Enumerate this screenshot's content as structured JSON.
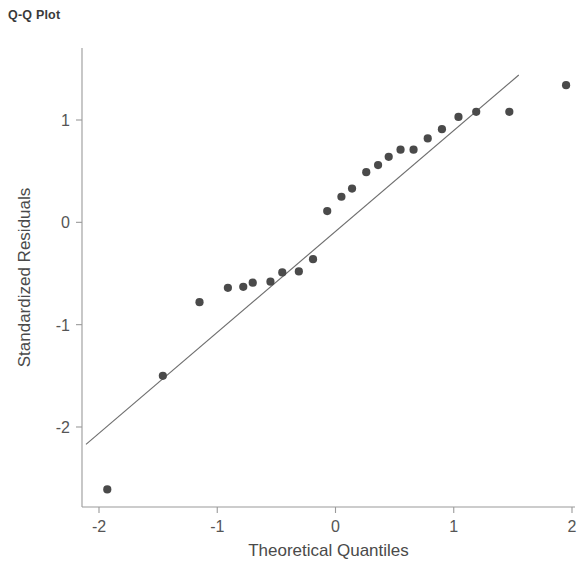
{
  "title": "Q-Q Plot",
  "chart_data": {
    "type": "scatter",
    "title": "Q-Q Plot",
    "xlabel": "Theoretical Quantiles",
    "ylabel": "Standardized Residuals",
    "xlim": [
      -2.25,
      2.15
    ],
    "ylim": [
      -2.95,
      1.65
    ],
    "xticks": [
      -2,
      -1,
      0,
      1,
      2
    ],
    "xticklabels": [
      "-2",
      "-1",
      "0",
      "1",
      "2"
    ],
    "yticks": [
      1,
      0,
      -1,
      -2
    ],
    "yticklabels": [
      "1",
      "0",
      "-1",
      "-2"
    ],
    "grid": false,
    "legend": null,
    "point_color": "#4a4a4a",
    "line_color": "#6e6e6e",
    "axis_color": "#9a9a9a",
    "series": [
      {
        "name": "Standardized residuals",
        "marker": "circle",
        "x": [
          -1.93,
          -1.46,
          -1.15,
          -0.91,
          -0.78,
          -0.7,
          -0.55,
          -0.45,
          -0.31,
          -0.19,
          -0.07,
          0.05,
          0.14,
          0.26,
          0.36,
          0.45,
          0.55,
          0.66,
          0.78,
          0.9,
          1.04,
          1.19,
          1.47,
          1.95
        ],
        "y": [
          -2.61,
          -1.5,
          -0.78,
          -0.64,
          -0.63,
          -0.59,
          -0.58,
          -0.49,
          -0.48,
          -0.36,
          0.11,
          0.25,
          0.33,
          0.49,
          0.56,
          0.64,
          0.71,
          0.71,
          0.82,
          0.91,
          1.03,
          1.08,
          1.08,
          1.34
        ]
      }
    ],
    "reference_line": {
      "name": "theoretical normal line",
      "x_start": -2.11,
      "y_start": -2.17,
      "x_end": 1.55,
      "y_end": 1.44
    }
  }
}
